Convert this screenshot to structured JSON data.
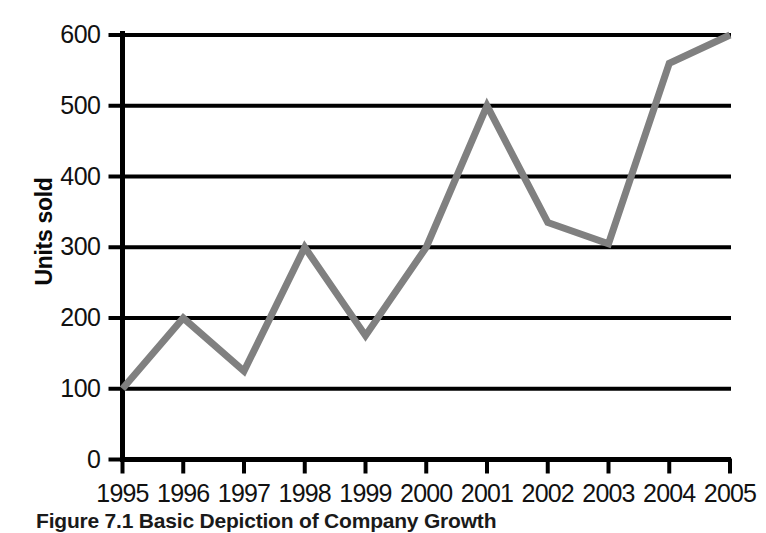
{
  "figure": {
    "caption": "Figure 7.1  Basic Depiction of Company Growth"
  },
  "chart_data": {
    "type": "line",
    "title": "",
    "xlabel": "",
    "ylabel": "Units sold",
    "x": [
      "1995",
      "1996",
      "1997",
      "1998",
      "1999",
      "2000",
      "2001",
      "2002",
      "2003",
      "2004",
      "2005"
    ],
    "values": [
      100,
      200,
      125,
      300,
      175,
      300,
      500,
      335,
      305,
      560,
      600
    ],
    "categories": [
      "1995",
      "1996",
      "1997",
      "1998",
      "1999",
      "2000",
      "2001",
      "2002",
      "2003",
      "2004",
      "2005"
    ],
    "ylim": [
      0,
      600
    ],
    "yticks": [
      0,
      100,
      200,
      300,
      400,
      500,
      600
    ],
    "ytick_labels": [
      "0",
      "100",
      "200",
      "300",
      "400",
      "500",
      "600"
    ],
    "xtick_labels": [
      "1995",
      "1996",
      "1997",
      "1998",
      "1999",
      "2000",
      "2001",
      "2002",
      "2003",
      "2004",
      "2005"
    ],
    "grid": true,
    "grid_axis": "y",
    "legend": false,
    "series_color": "#808080",
    "axis_color": "#000000",
    "line_width": 7
  }
}
